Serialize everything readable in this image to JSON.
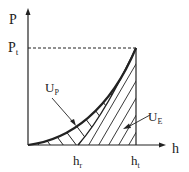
{
  "diagram": {
    "y_axis": {
      "label": "P",
      "marker": "P",
      "marker_sub": "t"
    },
    "x_axis": {
      "label": "h"
    },
    "ticks": [
      {
        "main": "h",
        "sub": "r"
      },
      {
        "main": "h",
        "sub": "t"
      }
    ],
    "regions": [
      {
        "main": "U",
        "sub": "P",
        "meaning": "plastic energy (between loading and unloading curves)"
      },
      {
        "main": "U",
        "sub": "E",
        "meaning": "elastic energy (under unloading curve)"
      }
    ],
    "colors": {
      "line": "#222222",
      "background": "#ffffff"
    }
  }
}
